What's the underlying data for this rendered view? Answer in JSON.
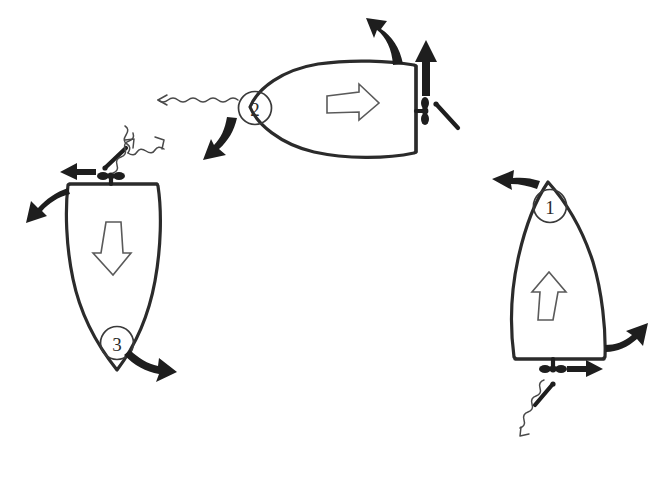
{
  "diagram": {
    "background_color": "#ffffff",
    "ink_color": "#2b2b2b",
    "hollow_arrow_color": "#ffffff",
    "hollow_arrow_stroke": "#5a5a5a",
    "solid_arrow_color": "#1e1e1e",
    "wavy_line_color": "#4a4a4a"
  },
  "boats": [
    {
      "id": "boat-1",
      "label": "1",
      "label_position": "bow",
      "orientation": "bow-up",
      "hull_arrow": "arrow-up",
      "hull_arrow_name": "thrust-arrow-up",
      "stern_feature": "outboard-propeller",
      "has_tiller_pin": true,
      "curved_arrows": [
        {
          "name": "bow-swing-left-arrow",
          "direction": "left"
        },
        {
          "name": "stern-swing-right-arrow",
          "direction": "right-up"
        }
      ],
      "straight_arrow": {
        "name": "stern-thrust-right-arrow",
        "direction": "right"
      },
      "wavy_arrow": {
        "name": "prop-wash-wavy-arrow",
        "direction": "down-left"
      }
    },
    {
      "id": "boat-2",
      "label": "2",
      "label_position": "bow",
      "orientation": "bow-left",
      "hull_arrow": "arrow-right",
      "hull_arrow_name": "thrust-arrow-right",
      "stern_feature": "outboard-propeller",
      "has_tiller_pin": true,
      "curved_arrows": [
        {
          "name": "stern-swing-up-left-arrow",
          "direction": "up-left"
        },
        {
          "name": "bow-swing-down-arrow",
          "direction": "down-left"
        }
      ],
      "straight_arrow": {
        "name": "stern-thrust-up-arrow",
        "direction": "up"
      },
      "wavy_arrow": {
        "name": "prop-wash-wavy-arrow",
        "direction": "left"
      }
    },
    {
      "id": "boat-3",
      "label": "3",
      "label_position": "stern",
      "orientation": "bow-down",
      "hull_arrow": "arrow-down",
      "hull_arrow_name": "thrust-arrow-down",
      "stern_feature": "outboard-propeller",
      "has_tiller_pin": true,
      "curved_arrows": [
        {
          "name": "stern-swing-down-left-arrow",
          "direction": "down-left"
        },
        {
          "name": "bow-swing-right-arrow",
          "direction": "right-down"
        }
      ],
      "straight_arrow": {
        "name": "stern-thrust-left-arrow",
        "direction": "left"
      },
      "wavy_arrow": {
        "name": "prop-wash-wavy-arrow",
        "direction": "up-right"
      }
    }
  ],
  "free_wavy_arrows": [
    {
      "name": "flow-wavy-arrow-upper-left",
      "direction": "up-right"
    }
  ]
}
